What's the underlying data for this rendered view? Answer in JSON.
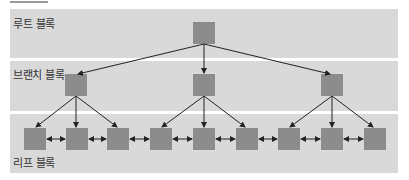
{
  "diagram": {
    "type": "b-tree-index-structure",
    "levels": [
      {
        "id": "root",
        "label": "루트 블록",
        "node_count": 1
      },
      {
        "id": "branch",
        "label": "브랜치 블록",
        "node_count": 3
      },
      {
        "id": "leaf",
        "label": "리프 블록",
        "node_count": 9
      }
    ],
    "colors": {
      "band": "#d9d9d9",
      "node": "#8c8c8c",
      "arrow": "#222222",
      "label": "#333333"
    },
    "edges": {
      "root_to_branch": [
        [
          0,
          0
        ],
        [
          0,
          1
        ],
        [
          0,
          2
        ]
      ],
      "branch_to_leaf": [
        [
          0,
          0
        ],
        [
          0,
          1
        ],
        [
          0,
          2
        ],
        [
          1,
          3
        ],
        [
          1,
          4
        ],
        [
          1,
          5
        ],
        [
          2,
          6
        ],
        [
          2,
          7
        ],
        [
          2,
          8
        ]
      ],
      "leaf_links": "bidirectional"
    }
  }
}
